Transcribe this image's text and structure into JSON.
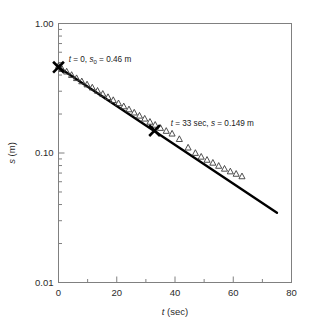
{
  "figure": {
    "background_color": "#ffffff",
    "frame_color": "#808080",
    "line_color": "#000000",
    "marker_color": "#3a3a3a"
  },
  "chart_data": {
    "type": "scatter",
    "title": "",
    "xlabel_plain": "t (sec)",
    "xlabel_italic": "t",
    "xlabel_rest": " (sec)",
    "ylabel_plain": "s (m)",
    "ylabel_italic": "s",
    "ylabel_rest": " (m)",
    "xscale": "linear",
    "yscale": "log",
    "xlim": [
      0,
      80
    ],
    "ylim": [
      0.01,
      1.0
    ],
    "grid": false,
    "legend": "none",
    "xticks": [
      0,
      20,
      40,
      60,
      80
    ],
    "xtick_labels": [
      "0",
      "20",
      "40",
      "60",
      "80"
    ],
    "xminor_ticks": [
      10,
      30,
      50,
      70
    ],
    "yticks": [
      1.0,
      0.1,
      0.01
    ],
    "ytick_labels": [
      "1.00",
      "0.10",
      "0.01"
    ],
    "yminor_decades": [
      2,
      3,
      4,
      5,
      6,
      7,
      8,
      9
    ],
    "series": [
      {
        "name": "measured-data",
        "marker": "open-triangle",
        "x": [
          0.0,
          1.2,
          2.8,
          4.5,
          6.2,
          8.0,
          9.8,
          11.6,
          13.4,
          15.2,
          17.0,
          18.8,
          20.6,
          22.4,
          24.2,
          26.0,
          27.8,
          29.6,
          31.4,
          33.2,
          35.0,
          37.0,
          39.0,
          41.5,
          44.5,
          47.0,
          49.0,
          51.0,
          53.0,
          55.0,
          57.0,
          59.0,
          61.0,
          63.0
        ],
        "y": [
          0.47,
          0.445,
          0.425,
          0.4,
          0.378,
          0.357,
          0.338,
          0.32,
          0.302,
          0.286,
          0.27,
          0.256,
          0.242,
          0.229,
          0.217,
          0.205,
          0.194,
          0.184,
          0.174,
          0.165,
          0.156,
          0.148,
          0.141,
          0.128,
          0.11,
          0.1,
          0.0935,
          0.0885,
          0.084,
          0.0795,
          0.0755,
          0.072,
          0.069,
          0.066
        ]
      },
      {
        "name": "fitted-line",
        "type": "line",
        "x": [
          0.0,
          75.0
        ],
        "y": [
          0.46,
          0.0345
        ]
      },
      {
        "name": "reference-markers",
        "marker": "bold-x",
        "x": [
          0.0,
          33.0
        ],
        "y": [
          0.46,
          0.149
        ]
      }
    ],
    "annotations": [
      {
        "name": "annotation-initial",
        "text": "t = 0, s0 = 0.46 m",
        "text_italic_1": "t",
        "text_mid_1": " = 0, ",
        "text_italic_2": "s",
        "text_sub_2": "0",
        "text_rest": " = 0.46 m",
        "x": 3.5,
        "y": 0.5
      },
      {
        "name": "annotation-reference",
        "text": "t = 33 sec, s = 0.149 m",
        "text_italic_1": "t",
        "text_mid_1": " = 33 sec, ",
        "text_italic_2": "s",
        "text_rest": " = 0.149 m",
        "x": 38.5,
        "y": 0.163
      }
    ]
  }
}
